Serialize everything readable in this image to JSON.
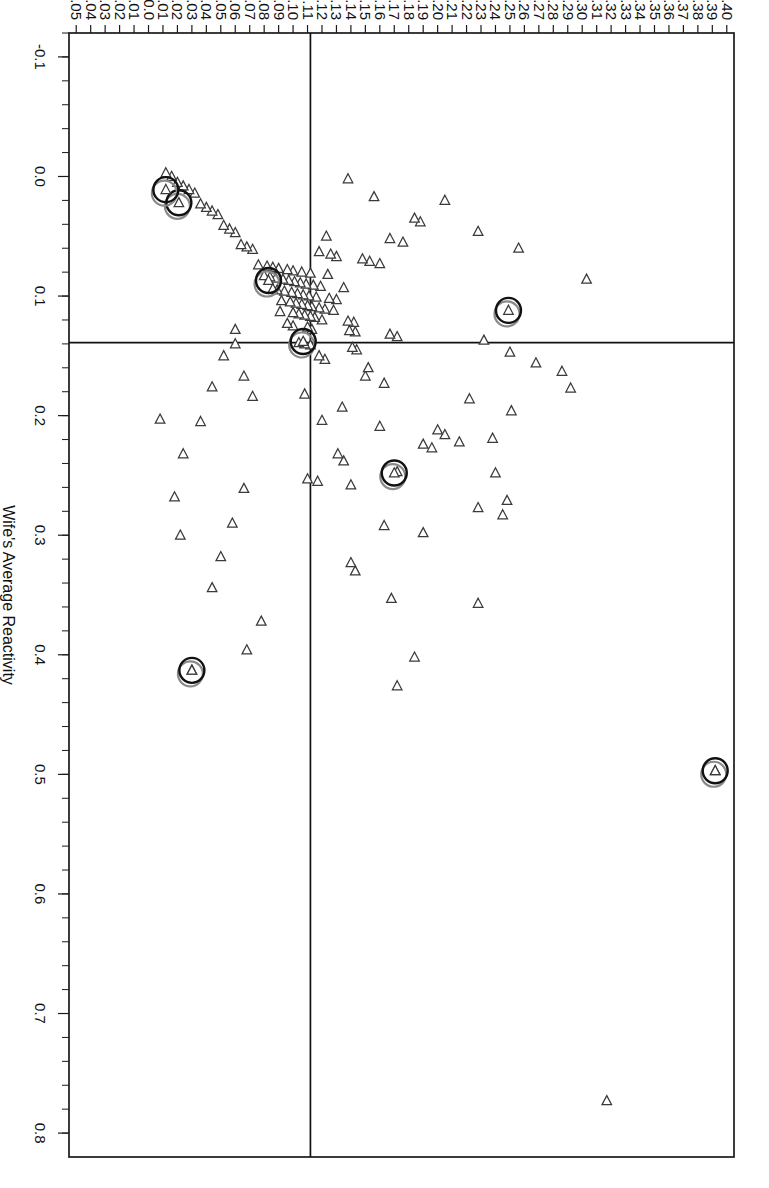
{
  "chart_data": {
    "type": "scatter",
    "title": "",
    "xlabel": "Wife's Average Reactivity",
    "ylabel": "Husband's Average Reactivity",
    "xlim": [
      -0.12,
      0.82
    ],
    "ylim": [
      -0.055,
      0.405
    ],
    "grid": false,
    "legend": "none",
    "orientation": "rotated-90-clockwise",
    "marker_shape": "left-pointing-triangle",
    "xticks_major": [
      "-0.1",
      "0.0",
      "0.1",
      "0.2",
      "0.3",
      "0.4",
      "0.5",
      "0.6",
      "0.7",
      "0.8"
    ],
    "xtick_major_values": [
      -0.1,
      0.0,
      0.1,
      0.2,
      0.3,
      0.4,
      0.5,
      0.6,
      0.7,
      0.8
    ],
    "xtick_minor_step": 0.02,
    "yticks": [
      "0.40",
      "0.39",
      "0.38",
      "0.37",
      "0.36",
      "0.35",
      "0.34",
      "0.33",
      "0.32",
      "0.31",
      "0.30",
      "0.29",
      "0.28",
      "0.27",
      "0.26",
      "0.25",
      "0.24",
      "0.23",
      "0.22",
      "0.21",
      "0.20",
      "0.19",
      "0.18",
      "0.17",
      "0.16",
      "0.15",
      "0.14",
      "0.13",
      "0.12",
      "0.11",
      "0.10",
      "0.09",
      "0.08",
      "0.07",
      "0.06",
      "0.05",
      "0.04",
      "0.03",
      "0.02",
      "0.01",
      "0.0",
      "-0.01",
      "-0.02",
      "-0.03",
      "-0.04",
      "-0.05"
    ],
    "ytick_values": [
      0.4,
      0.39,
      0.38,
      0.37,
      0.36,
      0.35,
      0.34,
      0.33,
      0.32,
      0.31,
      0.3,
      0.29,
      0.28,
      0.27,
      0.26,
      0.25,
      0.24,
      0.23,
      0.22,
      0.21,
      0.2,
      0.19,
      0.18,
      0.17,
      0.16,
      0.15,
      0.14,
      0.13,
      0.12,
      0.11,
      0.1,
      0.09,
      0.08,
      0.07,
      0.06,
      0.05,
      0.04,
      0.03,
      0.02,
      0.01,
      0.0,
      -0.01,
      -0.02,
      -0.03,
      -0.04,
      -0.05
    ],
    "reference_lines": [
      {
        "axis": "x",
        "value": 0.139,
        "color": "#111111"
      },
      {
        "axis": "y",
        "value": 0.112,
        "color": "#111111"
      }
    ],
    "colors": {
      "marker_stroke": "#3a3a3a",
      "marker_fill": "#ffffff",
      "highlight_outer": "#111111",
      "highlight_inner": "#8a8a8a",
      "axis": "#1a1a1a"
    },
    "points": [
      [
        0.773,
        0.317
      ],
      [
        0.497,
        0.392
      ],
      [
        0.413,
        0.03
      ],
      [
        0.426,
        0.172
      ],
      [
        0.402,
        0.184
      ],
      [
        0.357,
        0.228
      ],
      [
        0.353,
        0.168
      ],
      [
        0.33,
        0.143
      ],
      [
        0.323,
        0.14
      ],
      [
        0.298,
        0.19
      ],
      [
        0.292,
        0.163
      ],
      [
        0.283,
        0.245
      ],
      [
        0.277,
        0.228
      ],
      [
        0.271,
        0.248
      ],
      [
        0.258,
        0.14
      ],
      [
        0.255,
        0.117
      ],
      [
        0.253,
        0.11
      ],
      [
        0.248,
        0.24
      ],
      [
        0.247,
        0.172
      ],
      [
        0.238,
        0.135
      ],
      [
        0.232,
        0.131
      ],
      [
        0.227,
        0.196
      ],
      [
        0.224,
        0.19
      ],
      [
        0.222,
        0.215
      ],
      [
        0.219,
        0.238
      ],
      [
        0.216,
        0.205
      ],
      [
        0.212,
        0.2
      ],
      [
        0.209,
        0.16
      ],
      [
        0.204,
        0.12
      ],
      [
        0.196,
        0.251
      ],
      [
        0.193,
        0.134
      ],
      [
        0.186,
        0.222
      ],
      [
        0.182,
        0.108
      ],
      [
        0.177,
        0.292
      ],
      [
        0.173,
        0.163
      ],
      [
        0.167,
        0.15
      ],
      [
        0.163,
        0.286
      ],
      [
        0.16,
        0.152
      ],
      [
        0.156,
        0.268
      ],
      [
        0.153,
        0.122
      ],
      [
        0.15,
        0.118
      ],
      [
        0.147,
        0.25
      ],
      [
        0.145,
        0.144
      ],
      [
        0.143,
        0.141
      ],
      [
        0.141,
        0.112
      ],
      [
        0.14,
        0.108
      ],
      [
        0.139,
        0.104
      ],
      [
        0.137,
        0.232
      ],
      [
        0.134,
        0.172
      ],
      [
        0.132,
        0.167
      ],
      [
        0.13,
        0.143
      ],
      [
        0.129,
        0.139
      ],
      [
        0.128,
        0.113
      ],
      [
        0.126,
        0.11
      ],
      [
        0.125,
        0.1
      ],
      [
        0.123,
        0.096
      ],
      [
        0.122,
        0.142
      ],
      [
        0.121,
        0.138
      ],
      [
        0.12,
        0.12
      ],
      [
        0.118,
        0.115
      ],
      [
        0.117,
        0.112
      ],
      [
        0.116,
        0.108
      ],
      [
        0.115,
        0.104
      ],
      [
        0.114,
        0.1
      ],
      [
        0.113,
        0.091
      ],
      [
        0.112,
        0.128
      ],
      [
        0.111,
        0.122
      ],
      [
        0.11,
        0.118
      ],
      [
        0.109,
        0.113
      ],
      [
        0.108,
        0.11
      ],
      [
        0.107,
        0.106
      ],
      [
        0.106,
        0.102
      ],
      [
        0.105,
        0.098
      ],
      [
        0.104,
        0.092
      ],
      [
        0.103,
        0.13
      ],
      [
        0.102,
        0.125
      ],
      [
        0.101,
        0.116
      ],
      [
        0.1,
        0.111
      ],
      [
        0.099,
        0.107
      ],
      [
        0.098,
        0.103
      ],
      [
        0.097,
        0.099
      ],
      [
        0.096,
        0.094
      ],
      [
        0.095,
        0.089
      ],
      [
        0.094,
        0.086
      ],
      [
        0.093,
        0.135
      ],
      [
        0.092,
        0.119
      ],
      [
        0.091,
        0.114
      ],
      [
        0.09,
        0.109
      ],
      [
        0.089,
        0.105
      ],
      [
        0.088,
        0.101
      ],
      [
        0.087,
        0.097
      ],
      [
        0.086,
        0.093
      ],
      [
        0.085,
        0.088
      ],
      [
        0.084,
        0.084
      ],
      [
        0.083,
        0.08
      ],
      [
        0.082,
        0.124
      ],
      [
        0.081,
        0.112
      ],
      [
        0.08,
        0.106
      ],
      [
        0.079,
        0.1
      ],
      [
        0.078,
        0.096
      ],
      [
        0.077,
        0.09
      ],
      [
        0.076,
        0.086
      ],
      [
        0.075,
        0.082
      ],
      [
        0.074,
        0.076
      ],
      [
        0.073,
        0.16
      ],
      [
        0.071,
        0.153
      ],
      [
        0.069,
        0.148
      ],
      [
        0.067,
        0.13
      ],
      [
        0.065,
        0.126
      ],
      [
        0.063,
        0.118
      ],
      [
        0.061,
        0.072
      ],
      [
        0.059,
        0.068
      ],
      [
        0.057,
        0.064
      ],
      [
        0.055,
        0.176
      ],
      [
        0.052,
        0.167
      ],
      [
        0.05,
        0.123
      ],
      [
        0.047,
        0.06
      ],
      [
        0.044,
        0.056
      ],
      [
        0.041,
        0.052
      ],
      [
        0.038,
        0.188
      ],
      [
        0.035,
        0.184
      ],
      [
        0.032,
        0.048
      ],
      [
        0.029,
        0.044
      ],
      [
        0.026,
        0.04
      ],
      [
        0.023,
        0.036
      ],
      [
        0.02,
        0.205
      ],
      [
        0.017,
        0.156
      ],
      [
        0.014,
        0.032
      ],
      [
        0.011,
        0.028
      ],
      [
        0.008,
        0.024
      ],
      [
        0.005,
        0.02
      ],
      [
        0.002,
        0.138
      ],
      [
        0.0,
        0.016
      ],
      [
        -0.003,
        0.012
      ],
      [
        0.086,
        0.303
      ],
      [
        0.06,
        0.256
      ],
      [
        0.046,
        0.228
      ],
      [
        0.128,
        0.06
      ],
      [
        0.15,
        0.052
      ],
      [
        0.176,
        0.044
      ],
      [
        0.205,
        0.036
      ],
      [
        0.232,
        0.024
      ],
      [
        0.261,
        0.066
      ],
      [
        0.29,
        0.058
      ],
      [
        0.318,
        0.05
      ],
      [
        0.344,
        0.044
      ],
      [
        0.372,
        0.078
      ],
      [
        0.396,
        0.068
      ],
      [
        0.3,
        0.022
      ],
      [
        0.268,
        0.018
      ],
      [
        0.203,
        0.008
      ],
      [
        0.184,
        0.072
      ],
      [
        0.167,
        0.066
      ],
      [
        0.14,
        0.06
      ]
    ],
    "highlighted_points": [
      {
        "x": 0.497,
        "y": 0.392
      },
      {
        "x": 0.413,
        "y": 0.03
      },
      {
        "x": 0.248,
        "y": 0.17
      },
      {
        "x": 0.138,
        "y": 0.107
      },
      {
        "x": 0.112,
        "y": 0.249
      },
      {
        "x": 0.087,
        "y": 0.083
      },
      {
        "x": 0.022,
        "y": 0.021
      },
      {
        "x": 0.011,
        "y": 0.012
      }
    ]
  },
  "axes": {
    "x_title": "Wife's Average Reactivity",
    "y_title": "Husband's Average Reactivity"
  }
}
